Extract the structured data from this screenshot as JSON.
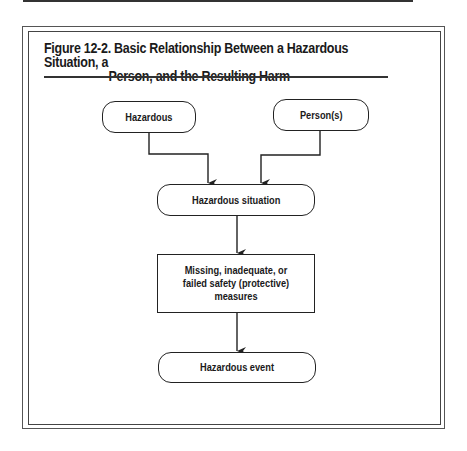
{
  "figure": {
    "title_number": "Figure 12-2.",
    "title_line1": "Basic Relationship Between a Hazardous Situation, a",
    "title_line2": "Person, and the Resulting Harm"
  },
  "diagram": {
    "nodes": [
      {
        "id": "hazardous",
        "label": "Hazardous",
        "shape": "rounded"
      },
      {
        "id": "persons",
        "label": "Person(s)",
        "shape": "rounded"
      },
      {
        "id": "hazardous-situation",
        "label": "Hazardous situation",
        "shape": "rounded"
      },
      {
        "id": "safety-measures",
        "label": "Missing, inadequate, or failed safety (protective) measures",
        "shape": "rectangle"
      },
      {
        "id": "hazardous-event",
        "label": "Hazardous event",
        "shape": "rounded"
      }
    ],
    "edges": [
      {
        "from": "hazardous",
        "to": "hazardous-situation"
      },
      {
        "from": "persons",
        "to": "hazardous-situation"
      },
      {
        "from": "hazardous-situation",
        "to": "safety-measures"
      },
      {
        "from": "safety-measures",
        "to": "hazardous-event"
      }
    ]
  }
}
